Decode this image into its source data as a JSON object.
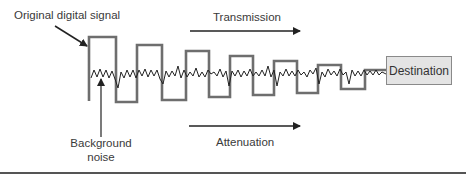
{
  "diagram": {
    "labels": {
      "original_signal": "Original digital signal",
      "transmission": "Transmission",
      "attenuation": "Attenuation",
      "background_noise_line1": "Background",
      "background_noise_line2": "noise",
      "destination": "Destination"
    },
    "colors": {
      "signal_stroke": "#6e6e6e",
      "noise_stroke": "#222222",
      "arrow": "#222222",
      "destination_fill": "#e4e4e4",
      "destination_border": "#8a8a8a",
      "divider": "#555555"
    },
    "square_wave_points": "89,101 89,37 116,37 116,102 137,102 137,45 162,45 162,100 186,100 186,51 209,51 209,97 230,97 230,56 253,56 253,95 274,95 274,61 297,61 297,93 318,93 318,65 341,65 341,89 365,89 365,70 386,70",
    "noise_points": "91,78 94,70 97,77 100,69 103,77 106,70 109,78 112,71 115,79 118,88 121,72 124,78 127,70 130,77 133,70 136,78 139,70 142,76 145,69 148,77 151,70 154,76 157,70 160,79 163,84 166,71 169,77 172,71 175,76 178,66 181,78 184,70 187,77 190,72 193,76 196,68 199,77 202,72 205,77 208,70 211,74 214,72 217,76 220,69 223,77 226,71 229,86 232,71 235,76 238,70 241,77 244,71 247,76 250,69 253,76 256,72 259,76 262,70 265,76 268,66 271,77 274,70 277,86 280,72 283,76 286,69 289,76 292,71 295,76 298,70 301,75 304,72 307,77 310,70 313,74 316,68 319,84 322,72 325,77 328,69 331,75 334,71 337,76 340,69 343,75 346,72 349,84 352,70 355,76 358,71 361,76 364,70 367,75 370,71 373,75 376,70 379,75 382,72 386,74"
  }
}
